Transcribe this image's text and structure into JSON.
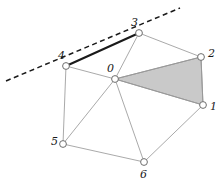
{
  "figure": {
    "type": "mesh-diagram",
    "width": 222,
    "height": 184,
    "background_color": "#ffffff"
  },
  "colors": {
    "thin_edge": "#9a9a9a",
    "thick_edge": "#1a1a1a",
    "dashed_line": "#1a1a1a",
    "shaded_triangle_fill": "#c9c9c9",
    "shaded_triangle_stroke": "#8a8a8a",
    "node_stroke": "#6e6e6e",
    "node_fill": "#ffffff",
    "label_color": "#1a1a1a"
  },
  "nodes": [
    {
      "id": "0",
      "label": "0",
      "cx": 115,
      "cy": 79,
      "r": 3.4,
      "label_x": 107,
      "label_y": 63
    },
    {
      "id": "1",
      "label": "1",
      "cx": 203,
      "cy": 105,
      "r": 3.4,
      "label_x": 210,
      "label_y": 101
    },
    {
      "id": "2",
      "label": "2",
      "cx": 201,
      "cy": 57,
      "r": 3.4,
      "label_x": 208,
      "label_y": 48
    },
    {
      "id": "3",
      "label": "3",
      "cx": 139,
      "cy": 33,
      "r": 3.4,
      "label_x": 131,
      "label_y": 17
    },
    {
      "id": "4",
      "label": "4",
      "cx": 66,
      "cy": 66,
      "r": 3.4,
      "label_x": 58,
      "label_y": 50
    },
    {
      "id": "5",
      "label": "5",
      "cx": 63,
      "cy": 144,
      "r": 3.4,
      "label_x": 51,
      "label_y": 136
    },
    {
      "id": "6",
      "label": "6",
      "cx": 144,
      "cy": 162,
      "r": 3.4,
      "label_x": 140,
      "label_y": 169
    }
  ],
  "edges": [
    {
      "from": "0",
      "to": "1",
      "style": "thin"
    },
    {
      "from": "0",
      "to": "2",
      "style": "thin"
    },
    {
      "from": "0",
      "to": "3",
      "style": "thin"
    },
    {
      "from": "0",
      "to": "4",
      "style": "thin"
    },
    {
      "from": "0",
      "to": "5",
      "style": "thin"
    },
    {
      "from": "0",
      "to": "6",
      "style": "thin"
    },
    {
      "from": "1",
      "to": "2",
      "style": "thin"
    },
    {
      "from": "2",
      "to": "3",
      "style": "thin"
    },
    {
      "from": "3",
      "to": "4",
      "style": "thick"
    },
    {
      "from": "4",
      "to": "5",
      "style": "thin"
    },
    {
      "from": "5",
      "to": "6",
      "style": "thin"
    },
    {
      "from": "6",
      "to": "1",
      "style": "thin"
    }
  ],
  "shaded_triangle": {
    "name": "shaded-triangle-0-2-1",
    "vertices": [
      "0",
      "2",
      "1"
    ],
    "points": "115,79 201,57 203,105"
  },
  "dashed_line": {
    "name": "dashed-tangent-line",
    "x1": 6,
    "y1": 81,
    "x2": 180,
    "y2": 8,
    "dash_pattern": "5,3.5"
  }
}
